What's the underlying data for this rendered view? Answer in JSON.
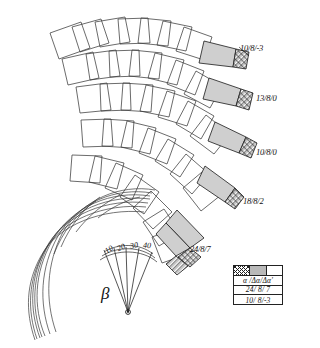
{
  "figure": {
    "title_symbol": "β",
    "background": "#ffffff",
    "ink_color": "#1a1a1a",
    "wedge_fill": "#cfcfcf",
    "tip_fill": "hatch"
  },
  "chain_labels": [
    {
      "id": "chain-1",
      "text": "10/8/-3",
      "x": 240,
      "y": 43
    },
    {
      "id": "chain-2",
      "text": "13/8/0",
      "x": 256,
      "y": 93
    },
    {
      "id": "chain-3",
      "text": "10/8/0",
      "x": 256,
      "y": 147
    },
    {
      "id": "chain-4",
      "text": "18/8/2",
      "x": 243,
      "y": 196
    },
    {
      "id": "chain-5",
      "text": "24/8/7",
      "x": 190,
      "y": 244
    }
  ],
  "angle_scale": {
    "name": "beta-fan-scale",
    "symbol": "β",
    "symbol_x": 101,
    "symbol_y": 288,
    "ticks": [
      {
        "label": "10",
        "x": 110,
        "y": 247,
        "rot": -34
      },
      {
        "label": "20",
        "x": 122,
        "y": 245,
        "rot": -22
      },
      {
        "label": "30",
        "x": 134,
        "y": 243,
        "rot": -10
      },
      {
        "label": "40",
        "x": 147,
        "y": 242,
        "rot": 2
      }
    ]
  },
  "legend": {
    "name": "legend-table",
    "swatches": [
      {
        "name": "hatched-swatch",
        "style": "hatch"
      },
      {
        "name": "grey-swatch",
        "style": "grey"
      },
      {
        "name": "white-swatch",
        "style": "white"
      }
    ],
    "header": "α /Δα/Δα'",
    "rows": [
      "24/ 8/ 7",
      "10/ 8/-3"
    ]
  }
}
